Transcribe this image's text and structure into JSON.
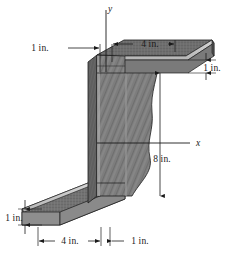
{
  "figure": {
    "object_name": "z-section-beam",
    "axes": {
      "y_label": "y",
      "x_label": "x"
    },
    "dimensions": [
      {
        "id": "top-left-web-offset",
        "label": "1 in.",
        "value": 1,
        "unit": "in.",
        "measures": "web thickness offset left of y-axis at top"
      },
      {
        "id": "top-flange-width",
        "label": "4 in.",
        "value": 4,
        "unit": "in.",
        "measures": "top flange width"
      },
      {
        "id": "top-flange-thickness",
        "label": "1 in.",
        "value": 1,
        "unit": "in.",
        "measures": "top flange thickness"
      },
      {
        "id": "web-height",
        "label": "8 in.",
        "value": 8,
        "unit": "in.",
        "measures": "overall web height"
      },
      {
        "id": "bottom-flange-thickness",
        "label": "1 in.",
        "value": 1,
        "unit": "in.",
        "measures": "bottom flange thickness"
      },
      {
        "id": "bottom-flange-width",
        "label": "4 in.",
        "value": 4,
        "unit": "in.",
        "measures": "bottom flange width"
      },
      {
        "id": "web-thickness",
        "label": "1 in.",
        "value": 1,
        "unit": "in.",
        "measures": "web thickness"
      }
    ],
    "colors": {
      "background": "#ffffff",
      "line": "#1a1a1a",
      "face_web": "#7d7d7d",
      "face_top": "#6b6b6b",
      "face_edge_light": "#c9c9c9",
      "face_side_dark": "#5c5c5c",
      "face_bottom_flange": "#757575"
    }
  }
}
